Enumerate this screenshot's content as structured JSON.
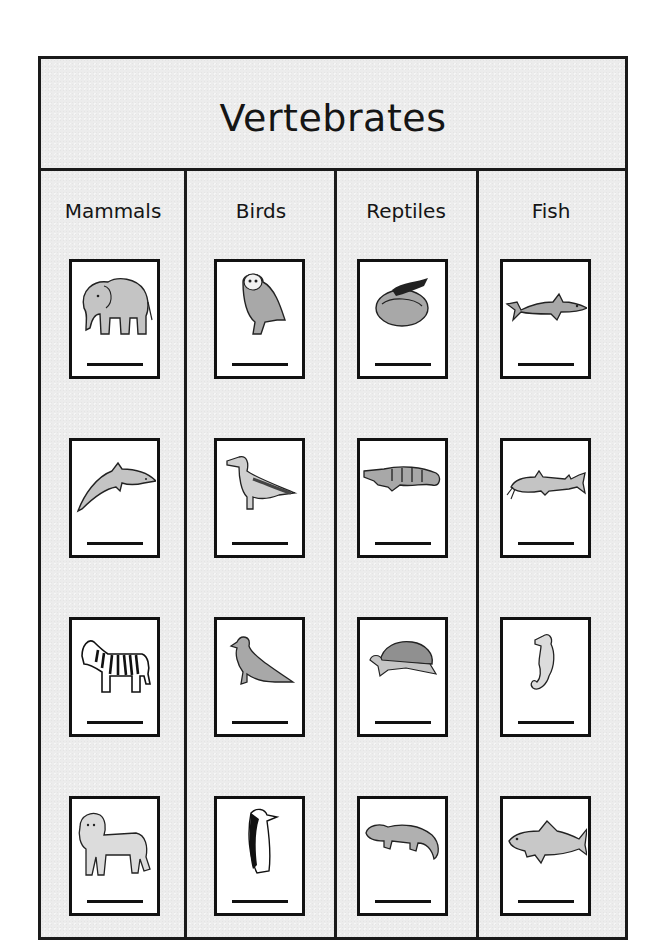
{
  "title": "Vertebrates",
  "columns": [
    {
      "label": "Mammals",
      "animals": [
        {
          "name": "elephant",
          "answer_blank": ""
        },
        {
          "name": "dolphin",
          "answer_blank": ""
        },
        {
          "name": "zebra",
          "answer_blank": ""
        },
        {
          "name": "lion",
          "answer_blank": ""
        }
      ]
    },
    {
      "label": "Birds",
      "animals": [
        {
          "name": "owl",
          "answer_blank": ""
        },
        {
          "name": "albatross",
          "answer_blank": ""
        },
        {
          "name": "pigeon",
          "answer_blank": ""
        },
        {
          "name": "penguin",
          "answer_blank": ""
        }
      ]
    },
    {
      "label": "Reptiles",
      "animals": [
        {
          "name": "snake",
          "answer_blank": ""
        },
        {
          "name": "alligator",
          "answer_blank": ""
        },
        {
          "name": "turtle",
          "answer_blank": ""
        },
        {
          "name": "salamander",
          "answer_blank": ""
        }
      ]
    },
    {
      "label": "Fish",
      "animals": [
        {
          "name": "shark",
          "answer_blank": ""
        },
        {
          "name": "catfish",
          "answer_blank": ""
        },
        {
          "name": "seahorse",
          "answer_blank": ""
        },
        {
          "name": "carp",
          "answer_blank": ""
        }
      ]
    }
  ],
  "colors": {
    "sheet_background": "#ececec",
    "border": "#1a1a1a",
    "card_background": "#ffffff",
    "illustration_fill": "#b8b8b8"
  }
}
